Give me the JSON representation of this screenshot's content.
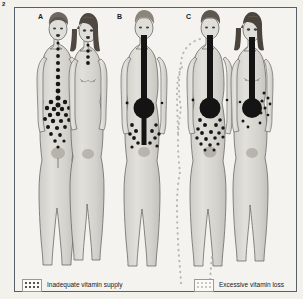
{
  "figure": {
    "number": "2",
    "panels": [
      {
        "id": "A",
        "label": "A"
      },
      {
        "id": "B",
        "label": "B"
      },
      {
        "id": "C",
        "label": "C"
      }
    ]
  },
  "legend": {
    "items": [
      {
        "swatch": "dotted-dark-swatch",
        "label": "Inadequate vitamin supply",
        "color": "#1d1d1d"
      },
      {
        "swatch": "dotted-light-swatch",
        "label": "Excessive vitamin loss",
        "color": "#b9b7b1"
      }
    ]
  },
  "colors": {
    "frame_border": "#55606a",
    "page_background": "#f3f1ec",
    "panel_background": "#f5f3ef",
    "body_fill": "#d9d7d2",
    "body_outline": "#6a6a66",
    "marker_dark": "#1a1a1a",
    "marker_light": "#b9b7b1",
    "hair_dark": "#4a4641",
    "hair_mid": "#8d887f"
  },
  "diagram": {
    "panel_a": {
      "description": "Two figures, male and female, with dark dot chain from mouth down midline spreading into abdominal cluster",
      "figures": [
        "male",
        "female"
      ],
      "marker_type": "dark-dots"
    },
    "panel_b": {
      "description": "Single figure with thick dark vertical bar from mouth to abdomen ending in large filled circle, with dark dots in lower abdomen",
      "figures": [
        "single"
      ],
      "marker_type": "dark-bar-and-bolus"
    },
    "panel_c": {
      "description": "Two figures each with thick dark vertical bar ending in large filled circle; left figure outlined with light dotted silhouette indicating excessive loss",
      "figures": [
        "male",
        "female"
      ],
      "marker_type": "dark-bar-and-bolus-with-light-dotted-outline"
    }
  }
}
